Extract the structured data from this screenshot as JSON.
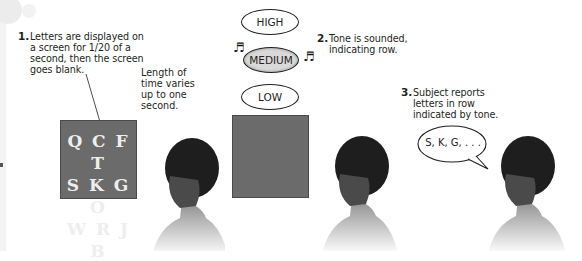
{
  "steps": [
    {
      "number": "1.",
      "lines": [
        "Letters are displayed on",
        "a screen for 1/20 of a",
        "second, then the screen",
        "goes blank."
      ]
    },
    {
      "number": "2.",
      "lines": [
        "Tone is sounded,",
        "indicating row."
      ]
    },
    {
      "number": "3.",
      "lines": [
        "Subject reports",
        "letters in row",
        "indicated by tone."
      ]
    }
  ],
  "delay_note": {
    "lines": [
      "Length of",
      "time varies",
      "up to one",
      "second."
    ]
  },
  "letter_grid": {
    "rows": [
      "Q C F T",
      "S K G O",
      "W R J B"
    ]
  },
  "tones": [
    {
      "label": "HIGH",
      "active": false
    },
    {
      "label": "MEDIUM",
      "active": true
    },
    {
      "label": "LOW",
      "active": false
    }
  ],
  "response": {
    "text": "S, K, G, . . ."
  },
  "colors": {
    "screen": "#6b6b6b",
    "letters": "#eeeeee",
    "active_tone": "#d9d9d9",
    "text": "#231f20"
  }
}
